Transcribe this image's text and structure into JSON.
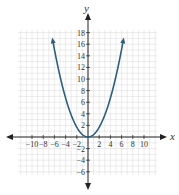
{
  "chart_data": {
    "type": "line",
    "title": "",
    "xlabel": "x",
    "ylabel": "y",
    "xlim": [
      -12.5,
      12.5
    ],
    "ylim": [
      -7.5,
      19
    ],
    "grid": true,
    "x_ticks": [
      -10,
      -8,
      -6,
      -4,
      -2,
      2,
      4,
      6,
      8,
      10
    ],
    "x_tick_labels": [
      "−10",
      "−8",
      "−6",
      "−4",
      "−2",
      "2",
      "4",
      "6",
      "8",
      "10"
    ],
    "y_ticks": [
      -6,
      -4,
      -2,
      2,
      4,
      6,
      8,
      10,
      12,
      14,
      16,
      18
    ],
    "y_tick_labels": [
      "−6",
      "−4",
      "−2",
      "2",
      "4",
      "6",
      "8",
      "10",
      "12",
      "14",
      "16",
      "18"
    ],
    "series": [
      {
        "name": "parabola",
        "color": "#2c5f7c",
        "description": "upward-opening parabola with vertex at origin, arrows at both ends",
        "x": [
          -6.4,
          -6,
          -5,
          -4,
          -3,
          -2,
          -1,
          0,
          1,
          2,
          3,
          4,
          5,
          6,
          6.4
        ],
        "y": [
          17.2,
          15.1,
          10.5,
          6.7,
          3.8,
          1.7,
          0.42,
          0,
          0.42,
          1.7,
          3.8,
          6.7,
          10.5,
          15.1,
          17.2
        ]
      }
    ],
    "vertex": [
      0,
      0
    ]
  },
  "colors": {
    "curve": "#2c5f7c",
    "axis": "#222222",
    "grid": "#d9d9d9"
  }
}
